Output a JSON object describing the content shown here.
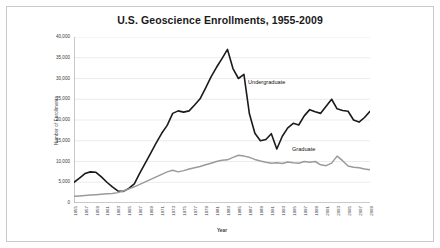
{
  "figure": {
    "title": "U.S. Geoscience Enrollments, 1955-2009",
    "frame_color": "#c9c9c9",
    "background": "#ffffff"
  },
  "annotations": {
    "undergraduate_label": "Undergraduate",
    "graduate_label": "Graduate"
  },
  "chart_data": {
    "type": "line",
    "title": "U.S. Geoscience Enrollments, 1955-2009",
    "xlabel": "Year",
    "ylabel": "Number of Enrollments",
    "ylim": [
      0,
      40000
    ],
    "xlim": [
      1955,
      2009
    ],
    "grid": true,
    "grid_axis": "y",
    "legend_position": "inline-annotation",
    "ytick_labels": [
      "0",
      "5,000",
      "10,000",
      "15,000",
      "20,000",
      "25,000",
      "30,000",
      "35,000",
      "40,000"
    ],
    "ytick_values": [
      0,
      5000,
      10000,
      15000,
      20000,
      25000,
      30000,
      35000,
      40000
    ],
    "xtick_labels": [
      "1955",
      "1957",
      "1959",
      "1961",
      "1963",
      "1965",
      "1967",
      "1969",
      "1971",
      "1973",
      "1975",
      "1977",
      "1979",
      "1981",
      "1983",
      "1985",
      "1987",
      "1989",
      "1991",
      "1993",
      "1995",
      "1997",
      "1999",
      "2001",
      "2003",
      "2005",
      "2007",
      "2009"
    ],
    "x": [
      1955,
      1956,
      1957,
      1958,
      1959,
      1960,
      1961,
      1962,
      1963,
      1964,
      1965,
      1966,
      1967,
      1968,
      1969,
      1970,
      1971,
      1972,
      1973,
      1974,
      1975,
      1976,
      1977,
      1978,
      1979,
      1980,
      1981,
      1982,
      1983,
      1984,
      1985,
      1986,
      1987,
      1988,
      1989,
      1990,
      1991,
      1992,
      1993,
      1994,
      1995,
      1996,
      1997,
      1998,
      1999,
      2000,
      2001,
      2002,
      2003,
      2004,
      2005,
      2006,
      2007,
      2008,
      2009
    ],
    "series": [
      {
        "name": "Undergraduate",
        "color": "#1a1a1a",
        "width": 1.6,
        "values": [
          5000,
          6000,
          7100,
          7500,
          7400,
          6300,
          5000,
          3900,
          2900,
          2800,
          3500,
          4600,
          7200,
          9600,
          12000,
          14500,
          16800,
          18700,
          21600,
          22200,
          21900,
          22200,
          23600,
          25100,
          27700,
          30400,
          32700,
          34800,
          37000,
          32400,
          30000,
          31000,
          21500,
          16800,
          15000,
          15300,
          16700,
          13000,
          16100,
          18100,
          19200,
          18800,
          21000,
          22500,
          22000,
          21600,
          23300,
          25000,
          22700,
          22300,
          22100,
          20000,
          19500,
          20600,
          22100
        ]
      },
      {
        "name": "Graduate",
        "color": "#9a9a9a",
        "width": 1.5,
        "values": [
          1600,
          1700,
          1800,
          1900,
          2000,
          2100,
          2200,
          2300,
          2500,
          2900,
          3400,
          3900,
          4500,
          5100,
          5700,
          6300,
          6900,
          7500,
          7900,
          7500,
          7800,
          8200,
          8500,
          8800,
          9200,
          9600,
          10000,
          10300,
          10400,
          11000,
          11500,
          11300,
          11000,
          10500,
          10100,
          9800,
          9600,
          9700,
          9500,
          9900,
          9700,
          9600,
          10000,
          9800,
          10000,
          9200,
          9000,
          9600,
          11300,
          10200,
          8900,
          8600,
          8500,
          8200,
          8000
        ]
      }
    ]
  }
}
